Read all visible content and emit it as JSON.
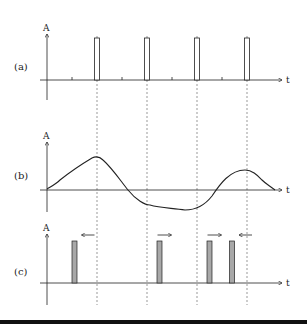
{
  "panels": [
    {
      "id": "a",
      "label": "(a)",
      "y_axis": "A",
      "x_axis": "t",
      "type": "pulse-train",
      "pulse_times": [
        1,
        2,
        3,
        4
      ],
      "tick_times": [
        0.5,
        1.5,
        2.5,
        3.5
      ]
    },
    {
      "id": "b",
      "label": "(b)",
      "y_axis": "A",
      "x_axis": "t",
      "type": "analog-signal"
    },
    {
      "id": "c",
      "label": "(c)",
      "y_axis": "A",
      "x_axis": "t",
      "type": "shifted-pulses",
      "pulses": [
        {
          "time": 0.55,
          "direction": "left"
        },
        {
          "time": 2.25,
          "direction": "right"
        },
        {
          "time": 3.25,
          "direction": "right"
        },
        {
          "time": 3.7,
          "direction": "left"
        }
      ]
    }
  ],
  "colors": {
    "line": "#222222",
    "bar_fill": "#a8a8a8",
    "dash": "#555555",
    "rule": "#111111"
  }
}
